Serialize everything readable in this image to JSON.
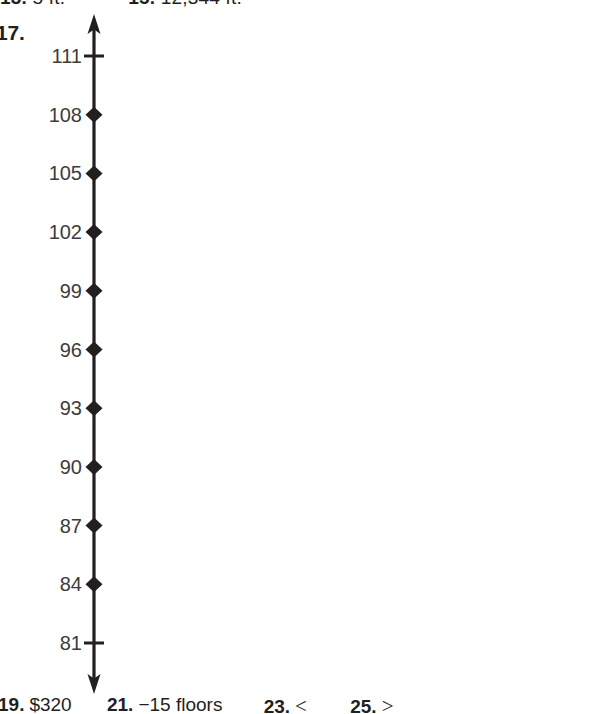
{
  "page": {
    "background_color": "#ffffff",
    "ink_color": "#231f20",
    "label_color": "#3c3c3b"
  },
  "top_clipped_row": {
    "note": "row of answers clipped at very top of the crop, only glyph bottoms visible",
    "items": [
      {
        "number": "13.",
        "text": "5 ft."
      },
      {
        "number": "15.",
        "text": "12,344 ft."
      }
    ]
  },
  "problem": {
    "number": "17."
  },
  "chart_data": {
    "type": "number-line",
    "title": "",
    "orientation": "vertical",
    "axis_arrows": [
      "top",
      "bottom"
    ],
    "tick_values": [
      111,
      108,
      105,
      102,
      99,
      96,
      93,
      90,
      87,
      84,
      81
    ],
    "tick_labels": [
      "111",
      "108",
      "105",
      "102",
      "99",
      "96",
      "93",
      "90",
      "87",
      "84",
      "81"
    ],
    "interval": 3,
    "range": [
      81,
      111
    ],
    "marker_type": "filled-diamond",
    "marked_values": [
      108,
      105,
      102,
      99,
      96,
      93,
      90,
      87,
      84
    ],
    "plain_tick_values": [
      111,
      81
    ],
    "grid": false,
    "xlabel": "",
    "ylabel": ""
  },
  "answers_row": {
    "items": [
      {
        "number": "19.",
        "text": "$320"
      },
      {
        "number": "21.",
        "text": "−15 floors"
      },
      {
        "number": "23.",
        "text": "<"
      },
      {
        "number": "25.",
        "text": ">"
      }
    ]
  }
}
